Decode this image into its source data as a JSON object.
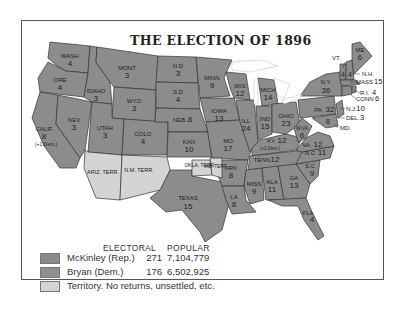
{
  "title": "THE ELECTION OF 1896",
  "colors": {
    "mckinley": "#8a8a8a",
    "bryan": "#8e8e8e",
    "territory": "#d4d4d4",
    "border": "#333333",
    "water": "#ffffff"
  },
  "legend": {
    "electoral_header": "ELECTORAL",
    "popular_header": "POPULAR",
    "rows": [
      {
        "name": "McKinley (Rep.)",
        "electoral": "271",
        "popular": "7,104,779"
      },
      {
        "name": "Bryan (Dem.)",
        "electoral": "176",
        "popular": "6,502,925"
      },
      {
        "name": "Territory. No returns, unsettled, etc.",
        "electoral": "",
        "popular": ""
      }
    ]
  },
  "states": {
    "wash": {
      "name": "WASH",
      "ev": "4"
    },
    "ore": {
      "name": "ORE",
      "ev": "4"
    },
    "calif": {
      "name": "CALIF",
      "ev": "8",
      "note": "(+1 Dem.)"
    },
    "nev": {
      "name": "NEV",
      "ev": "3"
    },
    "idaho": {
      "name": "IDAHO",
      "ev": "3"
    },
    "mont": {
      "name": "MONT",
      "ev": "3"
    },
    "wyo": {
      "name": "WYO",
      "ev": "3"
    },
    "utah": {
      "name": "UTAH",
      "ev": "3"
    },
    "colo": {
      "name": "COLO",
      "ev": "4"
    },
    "ariz": {
      "name": "ARIZ. TERR."
    },
    "nm": {
      "name": "N.M. TERR."
    },
    "nd": {
      "name": "N.D",
      "ev": "3"
    },
    "sd": {
      "name": "S.D",
      "ev": "4"
    },
    "neb": {
      "name": "NEB.",
      "ev": "8"
    },
    "kan": {
      "name": "KAN",
      "ev": "10"
    },
    "okla": {
      "name": "OKLA. TERR."
    },
    "ind_terr": {
      "name": "IND. TERR."
    },
    "texas": {
      "name": "TEXAS",
      "ev": "15"
    },
    "minn": {
      "name": "MINN",
      "ev": "9"
    },
    "iowa": {
      "name": "IOWA",
      "ev": "13"
    },
    "mo": {
      "name": "MO",
      "ev": "17"
    },
    "ark": {
      "name": "ARK",
      "ev": "8"
    },
    "la": {
      "name": "LA",
      "ev": "8"
    },
    "wis": {
      "name": "WIS",
      "ev": "12"
    },
    "ill": {
      "name": "ILL",
      "ev": "24"
    },
    "mich": {
      "name": "MICH",
      "ev": "14"
    },
    "ind": {
      "name": "IND",
      "ev": "15"
    },
    "ohio": {
      "name": "OHIO",
      "ev": "23"
    },
    "ky": {
      "name": "KY",
      "ev": "12",
      "note": "(+1 Dem.)"
    },
    "tenn": {
      "name": "TENN",
      "ev": "12"
    },
    "miss": {
      "name": "MISS",
      "ev": "9"
    },
    "ala": {
      "name": "ALA",
      "ev": "11"
    },
    "ga": {
      "name": "GA",
      "ev": "13"
    },
    "fla": {
      "name": "FLA",
      "ev": "4"
    },
    "sc": {
      "name": "S.C",
      "ev": "9"
    },
    "nc": {
      "name": "N.C",
      "ev": "11"
    },
    "va": {
      "name": "VA",
      "ev": "12"
    },
    "wva": {
      "name": "W.VA",
      "ev": "6"
    },
    "md": {
      "name": "MD.",
      "ev": "8"
    },
    "del": {
      "name": "DEL.",
      "ev": "3"
    },
    "nj": {
      "name": "N.J.",
      "ev": "10"
    },
    "pa": {
      "name": "PA",
      "ev": "32"
    },
    "ny": {
      "name": "N.Y.",
      "ev": "36"
    },
    "vt": {
      "name": "VT.",
      "ev": "4"
    },
    "nh": {
      "name": "N.H.",
      "ev": "4"
    },
    "me": {
      "name": "ME",
      "ev": "6"
    },
    "mass": {
      "name": "MASS",
      "ev": "15"
    },
    "ri": {
      "name": "R.I.",
      "ev": "4"
    },
    "conn": {
      "name": "CONN",
      "ev": "6"
    }
  }
}
